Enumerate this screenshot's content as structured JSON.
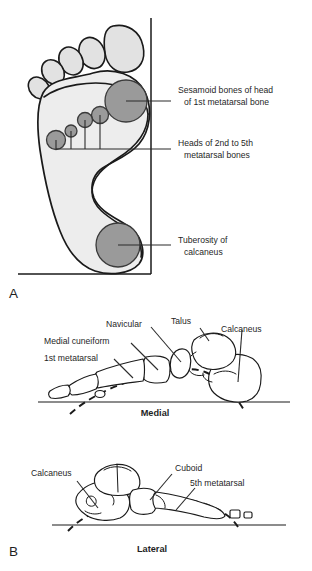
{
  "figure": {
    "panels": [
      {
        "id": "A",
        "letter": "A",
        "name": "plantar-pressure-view"
      },
      {
        "id": "B",
        "letter": "B",
        "name": "arches-lateral-medial-view"
      }
    ]
  },
  "panel_a": {
    "letter": "A",
    "callouts": [
      {
        "name": "sesamoid-bones-callout",
        "line1": "Sesamoid bones of head",
        "line2": "of 1st metatarsal bone",
        "target": "first-metatarsal-head-circle"
      },
      {
        "name": "metatarsal-heads-callout",
        "line1": "Heads of 2nd to 5th",
        "line2": "metatarsal bones",
        "target": "lesser-metatarsal-head-circles"
      },
      {
        "name": "calcaneal-tuberosity-callout",
        "line1": "Tuberosity of",
        "line2": "calcaneus",
        "target": "calcaneal-tuberosity-circle"
      }
    ],
    "pressure_points": [
      {
        "name": "first-metatarsal-head-circle",
        "cx": 126,
        "cy": 101,
        "r": 21,
        "label": "1st metatarsal head"
      },
      {
        "name": "second-metatarsal-head-circle",
        "cx": 100,
        "cy": 115,
        "r": 8.5,
        "label": "2nd metatarsal head"
      },
      {
        "name": "third-metatarsal-head-circle",
        "cx": 85,
        "cy": 120,
        "r": 7.5,
        "label": "3rd metatarsal head"
      },
      {
        "name": "fourth-metatarsal-head-circle",
        "cx": 71,
        "cy": 131,
        "r": 6.0,
        "label": "4th metatarsal head"
      },
      {
        "name": "fifth-metatarsal-head-circle",
        "cx": 56,
        "cy": 140,
        "r": 9.5,
        "label": "5th metatarsal head"
      },
      {
        "name": "calcaneal-tuberosity-circle",
        "cx": 118,
        "cy": 245,
        "r": 22,
        "label": "Calcaneal tuberosity"
      }
    ],
    "toes": [
      {
        "name": "great-toe",
        "label": "Hallux"
      },
      {
        "name": "second-toe",
        "label": "2nd toe"
      },
      {
        "name": "third-toe",
        "label": "3rd toe"
      },
      {
        "name": "fourth-toe",
        "label": "4th toe"
      },
      {
        "name": "fifth-toe",
        "label": "5th toe"
      }
    ]
  },
  "panel_b": {
    "letter": "B",
    "medial": {
      "view_label": "Medial",
      "bones": [
        {
          "name": "talus-label",
          "text": "Talus"
        },
        {
          "name": "calcaneus-label",
          "text": "Calcaneus"
        },
        {
          "name": "navicular-label",
          "text": "Navicular"
        },
        {
          "name": "medial-cuneiform-label",
          "text": "Medial cuneiform"
        },
        {
          "name": "first-metatarsal-label",
          "text": "1st metatarsal"
        }
      ]
    },
    "lateral": {
      "view_label": "Lateral",
      "bones": [
        {
          "name": "calcaneus-label",
          "text": "Calcaneus"
        },
        {
          "name": "cuboid-label",
          "text": "Cuboid"
        },
        {
          "name": "fifth-metatarsal-label",
          "text": "5th metatarsal"
        }
      ]
    }
  },
  "colors": {
    "pressure_fill": "#9a9a9a",
    "sole_fill": "#ededed",
    "toe_fill": "#e2e2e2",
    "ink": "#1a1a1a",
    "background": "#ffffff"
  }
}
